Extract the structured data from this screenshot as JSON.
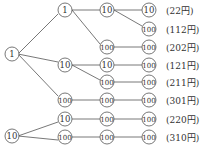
{
  "tree": {
    "roots": [
      {
        "value": "1",
        "x": 12,
        "y": 54
      },
      {
        "value": "10",
        "x": 12,
        "y": 136
      }
    ],
    "nodes": [
      {
        "value": "1",
        "x": 65,
        "y": 10
      },
      {
        "value": "10",
        "x": 65,
        "y": 65
      },
      {
        "value": "100",
        "x": 65,
        "y": 100
      },
      {
        "value": "10",
        "x": 65,
        "y": 119
      },
      {
        "value": "100",
        "x": 65,
        "y": 137
      },
      {
        "value": "10",
        "x": 107,
        "y": 10
      },
      {
        "value": "100",
        "x": 107,
        "y": 47
      },
      {
        "value": "10",
        "x": 107,
        "y": 65
      },
      {
        "value": "100",
        "x": 107,
        "y": 82
      },
      {
        "value": "100",
        "x": 107,
        "y": 100
      },
      {
        "value": "100",
        "x": 107,
        "y": 119
      },
      {
        "value": "100",
        "x": 107,
        "y": 137
      },
      {
        "value": "10",
        "x": 149,
        "y": 10
      },
      {
        "value": "100",
        "x": 149,
        "y": 29
      },
      {
        "value": "100",
        "x": 149,
        "y": 47
      },
      {
        "value": "100",
        "x": 149,
        "y": 65
      },
      {
        "value": "100",
        "x": 149,
        "y": 82
      },
      {
        "value": "100",
        "x": 149,
        "y": 100
      },
      {
        "value": "100",
        "x": 149,
        "y": 119
      },
      {
        "value": "100",
        "x": 149,
        "y": 137
      }
    ],
    "totals": [
      "(22円)",
      "(112円)",
      "(202円)",
      "(121円)",
      "(211円)",
      "(301円)",
      "(220円)",
      "(310円)"
    ]
  }
}
